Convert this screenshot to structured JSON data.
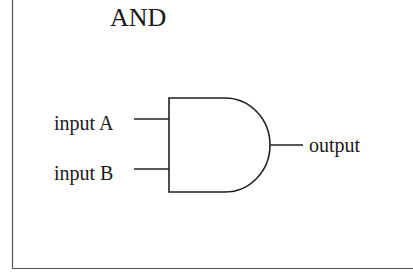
{
  "diagram": {
    "title": "AND",
    "gate_type": "AND gate",
    "inputs": [
      {
        "label": "input A"
      },
      {
        "label": "input B"
      }
    ],
    "output": {
      "label": "output"
    },
    "stroke_color": "#222222",
    "background": "#ffffff"
  }
}
